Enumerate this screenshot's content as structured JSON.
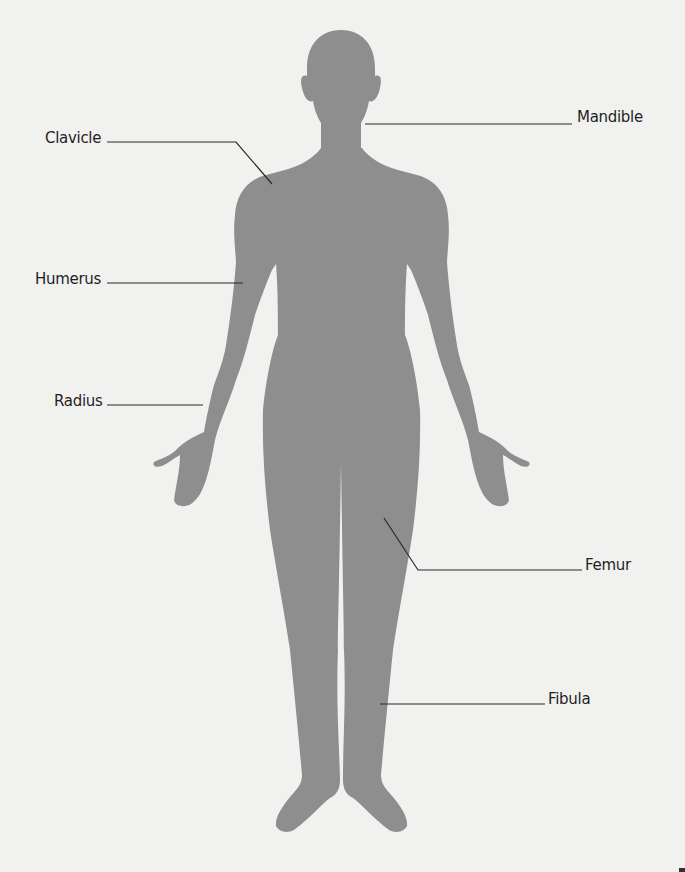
{
  "diagram": {
    "title": "",
    "colors": {
      "background": "#f1f1f0",
      "silhouette": "#8e8e8e",
      "leader_line": "#2a2a2a",
      "label_text": "#1f1f1f"
    },
    "labels": [
      {
        "id": "mandible",
        "text": "Mandible",
        "side": "right"
      },
      {
        "id": "clavicle",
        "text": "Clavicle",
        "side": "left"
      },
      {
        "id": "humerus",
        "text": "Humerus",
        "side": "left"
      },
      {
        "id": "radius",
        "text": "Radius",
        "side": "left"
      },
      {
        "id": "femur",
        "text": "Femur",
        "side": "right"
      },
      {
        "id": "fibula",
        "text": "Fibula",
        "side": "right"
      }
    ]
  }
}
